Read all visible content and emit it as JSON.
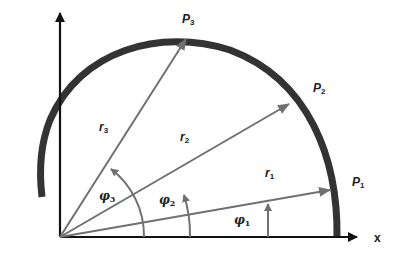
{
  "diagram": {
    "type": "polar-coordinate-curve",
    "axes": {
      "x_label": "x",
      "y_label": ""
    },
    "points": [
      {
        "id": "P1",
        "label": "P",
        "sub": "1",
        "radius_label": "r",
        "radius_sub": "1",
        "angle_label": "φ",
        "angle_sub": "1"
      },
      {
        "id": "P2",
        "label": "P",
        "sub": "2",
        "radius_label": "r",
        "radius_sub": "2",
        "angle_label": "φ",
        "angle_sub": "2"
      },
      {
        "id": "P3",
        "label": "P",
        "sub": "3",
        "radius_label": "r",
        "radius_sub": "3",
        "angle_label": "φ",
        "angle_sub": "3"
      }
    ],
    "colors": {
      "curve": "#333333",
      "axes": "#111111",
      "vectors": "#707070",
      "text": "#222222"
    }
  }
}
